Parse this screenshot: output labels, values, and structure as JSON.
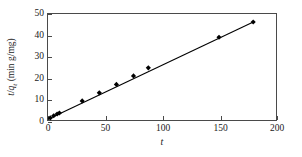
{
  "chart_data": {
    "type": "scatter",
    "title": "",
    "xlabel": "t",
    "ylabel": "t/q_t (min g/mg)",
    "ylabel_parts": {
      "numerator": "t",
      "denominator": "q",
      "subscript": "t",
      "units": "(min g/mg)"
    },
    "xlim": [
      0,
      200
    ],
    "ylim": [
      0,
      50
    ],
    "xticks": [
      0,
      50,
      100,
      150,
      200
    ],
    "yticks": [
      0,
      10,
      20,
      30,
      40,
      50
    ],
    "grid": false,
    "legend": null,
    "series": [
      {
        "name": "t/qt vs t",
        "marker": "diamond",
        "color": "#000000",
        "x": [
          2,
          5,
          8,
          10,
          30,
          45,
          60,
          75,
          88,
          150,
          180
        ],
        "y": [
          1.0,
          2.0,
          2.8,
          3.3,
          9.0,
          12.8,
          16.8,
          20.8,
          24.6,
          39.0,
          46.2
        ]
      }
    ],
    "fit_line": {
      "name": "linear fit",
      "color": "#000000",
      "x": [
        0,
        181
      ],
      "y": [
        0.3,
        46.5
      ]
    }
  },
  "axes": {
    "x_tick_labels": [
      "0",
      "50",
      "100",
      "150",
      "200"
    ],
    "y_tick_labels": [
      "0",
      "10",
      "20",
      "30",
      "40",
      "50"
    ]
  }
}
